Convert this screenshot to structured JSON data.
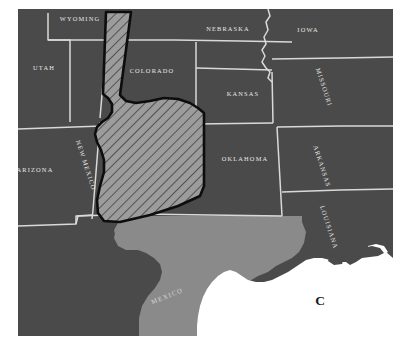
{
  "figure": {
    "panel_letter": "C",
    "type": "thematic-region-map"
  },
  "colors": {
    "land_dark": "#4a4a4a",
    "land_light": "#8a8a8a",
    "water": "#ffffff",
    "state_border": "#d9d9d7",
    "label_text": "#e8e8e6",
    "study_area_outline": "#0d0d0d",
    "study_area_fill": "#9c9c9c",
    "hatch_line": "#3c3c3c",
    "page_background": "#ffffff",
    "panel_letter": "#1a1a1a"
  },
  "map": {
    "states": [
      {
        "id": "wyoming",
        "label": "WYOMING",
        "x": 80,
        "y": 21,
        "rotation": 0,
        "region": "dark"
      },
      {
        "id": "utah",
        "label": "UTAH",
        "x": 44,
        "y": 70,
        "rotation": 0,
        "region": "dark"
      },
      {
        "id": "colorado",
        "label": "COLORADO",
        "x": 152,
        "y": 73,
        "rotation": 0,
        "region": "dark"
      },
      {
        "id": "nebraska",
        "label": "NEBRASKA",
        "x": 228,
        "y": 31,
        "rotation": 0,
        "region": "dark"
      },
      {
        "id": "iowa",
        "label": "IOWA",
        "x": 308,
        "y": 32,
        "rotation": 0,
        "region": "dark"
      },
      {
        "id": "kansas",
        "label": "KANSAS",
        "x": 243,
        "y": 96,
        "rotation": 0,
        "region": "dark"
      },
      {
        "id": "missouri",
        "label": "MISSOURI",
        "x": 322,
        "y": 88,
        "rotation": 72,
        "region": "dark"
      },
      {
        "id": "arizona",
        "label": "ARIZONA",
        "x": 35,
        "y": 172,
        "rotation": 0,
        "region": "dark"
      },
      {
        "id": "new-mexico",
        "label": "NEW MEXICO",
        "x": 84,
        "y": 166,
        "rotation": 72,
        "region": "dark"
      },
      {
        "id": "oklahoma",
        "label": "OKLAHOMA",
        "x": 245,
        "y": 161,
        "rotation": 0,
        "region": "dark"
      },
      {
        "id": "arkansas",
        "label": "ARKANSAS",
        "x": 320,
        "y": 167,
        "rotation": 72,
        "region": "dark"
      },
      {
        "id": "louisiana",
        "label": "LOUISIANA",
        "x": 327,
        "y": 228,
        "rotation": 72,
        "region": "dark"
      }
    ],
    "countries": [
      {
        "id": "mexico",
        "label": "MEXICO",
        "x": 168,
        "y": 298,
        "rotation": -22,
        "region": "light"
      }
    ],
    "water_bodies": [
      {
        "id": "gulf-of-mexico",
        "label": "",
        "region": "water"
      }
    ],
    "study_area": {
      "id": "study-area-polygon",
      "label": "",
      "fill_style": "diagonal-hatch",
      "hatch_angle_deg": 45
    }
  }
}
